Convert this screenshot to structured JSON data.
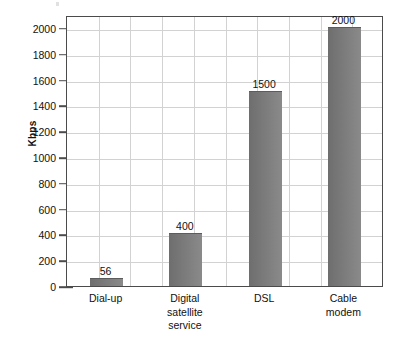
{
  "chart_data": {
    "type": "bar",
    "title": "",
    "xlabel": "",
    "ylabel": "Kbps",
    "categories": [
      "Dial-up",
      "Digital satellite service",
      "DSL",
      "Cable modem"
    ],
    "category_label_lines": [
      [
        "Dial-up"
      ],
      [
        "Digital",
        "satellite",
        "service"
      ],
      [
        "DSL"
      ],
      [
        "Cable",
        "modem"
      ]
    ],
    "values": [
      56,
      400,
      1500,
      2000
    ],
    "value_labels": [
      "56",
      "400",
      "1500",
      "2000"
    ],
    "ylim": [
      0,
      2100
    ],
    "ytick_values": [
      0,
      200,
      400,
      600,
      800,
      1000,
      1200,
      1400,
      1600,
      1800,
      2000
    ],
    "ytick_labels": [
      "0",
      "200",
      "400",
      "600",
      "800",
      "1000",
      "1200",
      "1400",
      "1600",
      "1800",
      "2000"
    ],
    "grid": {
      "horizontal": true,
      "vertical": true,
      "vertical_count": 9,
      "color": "#d2d2d2"
    },
    "legend": {
      "visible": false,
      "position": "none"
    },
    "colors": {
      "bar_fill_dark": "#6e6e6e",
      "bar_fill_light": "#8a8a8a",
      "axis": "#4b4b4b",
      "grid": "#d2d2d2",
      "text": "#111111",
      "background": "#ffffff"
    }
  }
}
